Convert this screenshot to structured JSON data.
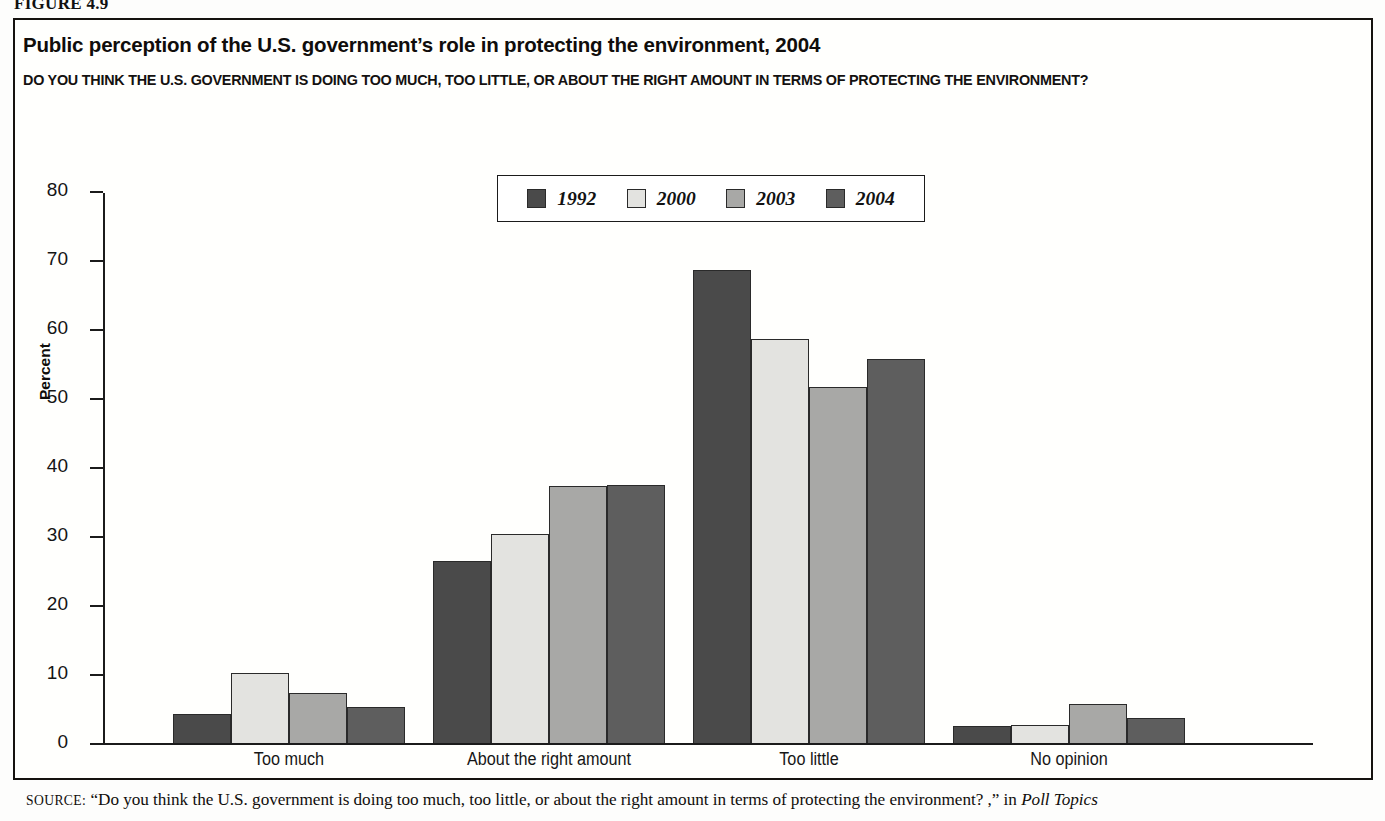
{
  "figure": {
    "number_label": "FIGURE 4.9"
  },
  "header": {
    "title": "Public perception of the U.S. government’s role in protecting the environment, 2004",
    "subtitle": "DO YOU THINK THE U.S. GOVERNMENT IS DOING TOO MUCH, TOO LITTLE, OR ABOUT THE RIGHT AMOUNT IN TERMS OF PROTECTING THE ENVIRONMENT?"
  },
  "source": {
    "label": "SOURCE:",
    "text": "“Do you think the U.S. government is doing too much, too little, or about the right amount in terms of protecting the environment? ,” in",
    "italic_tail": "Poll Topics"
  },
  "colors": {
    "series_1992": "#4a4a4a",
    "series_2000": "#e3e3e0",
    "series_2003": "#a8a8a6",
    "series_2004": "#5e5e5e",
    "axis": "#1b1b1b",
    "bar_outline": "#2a2a2a",
    "frame": "#15120f",
    "background": "#fffffd"
  },
  "chart_data": {
    "type": "bar",
    "title": "Public perception of the U.S. government’s role in protecting the environment, 2004",
    "subtitle": "DO YOU THINK THE U.S. GOVERNMENT IS DOING TOO MUCH, TOO LITTLE, OR ABOUT THE RIGHT AMOUNT IN TERMS OF PROTECTING THE ENVIRONMENT?",
    "xlabel": "",
    "ylabel": "Percent",
    "ylim": [
      0,
      80
    ],
    "ytick_step": 10,
    "yticks": [
      0,
      10,
      20,
      30,
      40,
      50,
      60,
      70,
      80
    ],
    "ytick_labels": [
      "0",
      "10",
      "20",
      "30",
      "40",
      "50",
      "60",
      "70",
      "80"
    ],
    "grid": false,
    "legend_position": "top-center",
    "categories": [
      "Too much",
      "About the right amount",
      "Too little",
      "No opinion"
    ],
    "series": [
      {
        "name": "1992",
        "color": "#4a4a4a",
        "values": [
          4.2,
          26.4,
          68.6,
          2.5
        ]
      },
      {
        "name": "2000",
        "color": "#e3e3e0",
        "values": [
          10.2,
          30.3,
          58.5,
          2.6
        ]
      },
      {
        "name": "2003",
        "color": "#a8a8a6",
        "values": [
          7.2,
          37.2,
          51.6,
          5.6
        ]
      },
      {
        "name": "2004",
        "color": "#5e5e5e",
        "values": [
          5.2,
          37.4,
          55.6,
          3.6
        ]
      }
    ]
  },
  "layout": {
    "group_left_px": [
      70,
      330,
      590,
      850
    ],
    "group_width_px": 232,
    "bar_width_px": 58
  }
}
